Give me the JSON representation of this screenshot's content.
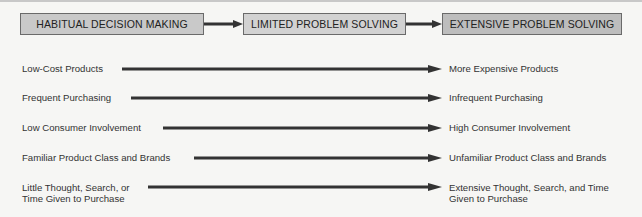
{
  "diagram": {
    "stages": [
      {
        "label": "HABITUAL DECISION MAKING"
      },
      {
        "label": "LIMITED PROBLEM SOLVING"
      },
      {
        "label": "EXTENSIVE PROBLEM SOLVING"
      }
    ],
    "continua": [
      {
        "from": "Low-Cost Products",
        "to": "More Expensive Products"
      },
      {
        "from": "Frequent Purchasing",
        "to": "Infrequent Purchasing"
      },
      {
        "from": "Low Consumer Involvement",
        "to": "High Consumer Involvement"
      },
      {
        "from": "Familiar Product Class and Brands",
        "to": "Unfamiliar Product Class and Brands"
      },
      {
        "from_line1": "Little Thought, Search, or",
        "from_line2": "Time Given to Purchase",
        "to_line1": "Extensive Thought, Search, and Time",
        "to_line2": "Given to Purchase"
      }
    ],
    "colors": {
      "box_fill": "#c9c9c9",
      "box_border": "#6a6a6a",
      "arrow": "#333333",
      "background": "#f6f6f4"
    }
  }
}
